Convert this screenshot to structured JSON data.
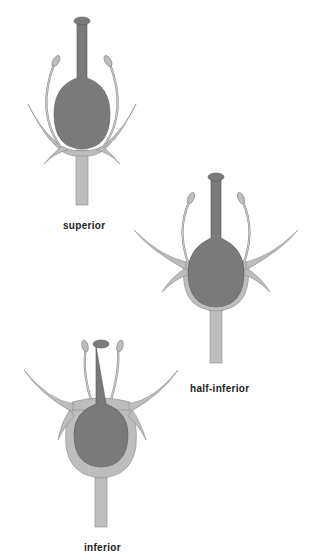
{
  "colors": {
    "ovary": "#7a7a7a",
    "receptacle": "#bdbdbd",
    "outline": "#5a5a5a",
    "background": "#ffffff"
  },
  "diagrams": [
    {
      "id": "superior",
      "label": "superior"
    },
    {
      "id": "half-inferior",
      "label": "half-inferior"
    },
    {
      "id": "inferior",
      "label": "inferior"
    }
  ]
}
